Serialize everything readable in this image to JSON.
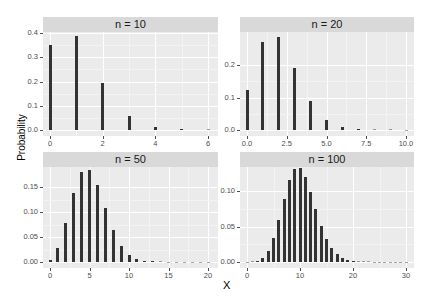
{
  "chart_data": [
    {
      "type": "bar",
      "title": "n = 10",
      "xlabel": "X",
      "ylabel": "Probability",
      "x": [
        0,
        1,
        2,
        3,
        4,
        5,
        6
      ],
      "values": [
        0.349,
        0.387,
        0.194,
        0.057,
        0.011,
        0.001,
        0.0001
      ],
      "xlim": [
        0,
        6
      ],
      "ylim": [
        0,
        0.4
      ],
      "xticks": [
        "0",
        "2",
        "4",
        "6"
      ],
      "yticks": [
        "0.0",
        "0.1",
        "0.2",
        "0.3",
        "0.4"
      ]
    },
    {
      "type": "bar",
      "title": "n = 20",
      "xlabel": "X",
      "ylabel": "Probability",
      "x": [
        0,
        1,
        2,
        3,
        4,
        5,
        6,
        7,
        8,
        9,
        10
      ],
      "values": [
        0.122,
        0.27,
        0.285,
        0.19,
        0.09,
        0.032,
        0.009,
        0.002,
        0.0004,
        0.0001,
        0.0
      ],
      "xlim": [
        0,
        10
      ],
      "ylim": [
        0,
        0.29
      ],
      "xticks": [
        "0.0",
        "2.5",
        "5.0",
        "7.5",
        "10.0"
      ],
      "yticks": [
        "0.0",
        "0.1",
        "0.2"
      ]
    },
    {
      "type": "bar",
      "title": "n = 50",
      "xlabel": "X",
      "ylabel": "Probability",
      "x": [
        0,
        1,
        2,
        3,
        4,
        5,
        6,
        7,
        8,
        9,
        10,
        11,
        12,
        13,
        14,
        15,
        16,
        17,
        18,
        19,
        20
      ],
      "values": [
        0.005,
        0.029,
        0.078,
        0.139,
        0.181,
        0.185,
        0.154,
        0.108,
        0.064,
        0.033,
        0.015,
        0.006,
        0.002,
        0.001,
        0.0002,
        0.0,
        0.0,
        0.0,
        0.0,
        0.0,
        0.0
      ],
      "xlim": [
        0,
        20
      ],
      "ylim": [
        0,
        0.185
      ],
      "xticks": [
        "0",
        "5",
        "10",
        "15",
        "20"
      ],
      "yticks": [
        "0.00",
        "0.05",
        "0.10",
        "0.15"
      ]
    },
    {
      "type": "bar",
      "title": "n = 100",
      "xlabel": "X",
      "ylabel": "Probability",
      "x": [
        0,
        1,
        2,
        3,
        4,
        5,
        6,
        7,
        8,
        9,
        10,
        11,
        12,
        13,
        14,
        15,
        16,
        17,
        18,
        19,
        20,
        21,
        22,
        23,
        24,
        25,
        26,
        27,
        28,
        29,
        30
      ],
      "values": [
        0.0,
        0.0003,
        0.0016,
        0.0059,
        0.0159,
        0.0339,
        0.0596,
        0.0889,
        0.1148,
        0.1304,
        0.1319,
        0.1199,
        0.0988,
        0.0743,
        0.0513,
        0.0327,
        0.0193,
        0.0106,
        0.0054,
        0.0026,
        0.0012,
        0.0005,
        0.0002,
        0.0001,
        0.0,
        0.0,
        0.0,
        0.0,
        0.0,
        0.0,
        0.0
      ],
      "xlim": [
        0,
        30
      ],
      "ylim": [
        0,
        0.132
      ],
      "xticks": [
        "0",
        "10",
        "20",
        "30"
      ],
      "yticks": [
        "0.00",
        "0.05",
        "0.10"
      ]
    }
  ],
  "labels": {
    "xlabel": "X",
    "ylabel": "Probability",
    "panel_titles": [
      "n = 10",
      "n = 20",
      "n = 50",
      "n = 100"
    ]
  },
  "layout": {
    "panels": [
      {
        "left": 43,
        "top": 17,
        "width": 175,
        "plot_top": 32,
        "plot_height": 104,
        "zero_y": 130,
        "x0": 50,
        "x1": 208,
        "xmax": 6,
        "ymax_val": 0.4,
        "ymax_px": 33,
        "yticks_val": [
          0,
          0.1,
          0.2,
          0.3,
          0.4
        ],
        "xticks_val": [
          0,
          2,
          4,
          6
        ],
        "bar_w": 3
      },
      {
        "left": 240,
        "top": 17,
        "width": 174,
        "plot_top": 32,
        "plot_height": 104,
        "zero_y": 130,
        "x0": 247,
        "x1": 406,
        "xmax": 10,
        "ymax_val": 0.2,
        "ymax_px": 65,
        "yticks_val": [
          0,
          0.1,
          0.2
        ],
        "xticks_val": [
          0,
          2.5,
          5,
          7.5,
          10
        ],
        "bar_w": 3
      },
      {
        "left": 43,
        "top": 152,
        "width": 175,
        "plot_top": 167,
        "plot_height": 101,
        "zero_y": 262,
        "x0": 50,
        "x1": 208,
        "xmax": 20,
        "ymax_val": 0.15,
        "ymax_px": 187,
        "yticks_val": [
          0,
          0.05,
          0.1,
          0.15
        ],
        "xticks_val": [
          0,
          5,
          10,
          15,
          20
        ],
        "bar_w": 3
      },
      {
        "left": 240,
        "top": 152,
        "width": 174,
        "plot_top": 167,
        "plot_height": 101,
        "zero_y": 262,
        "x0": 247,
        "x1": 406,
        "xmax": 30,
        "ymax_val": 0.1,
        "ymax_px": 191,
        "yticks_val": [
          0,
          0.05,
          0.1
        ],
        "xticks_val": [
          0,
          10,
          20,
          30
        ],
        "bar_w": 3
      }
    ]
  }
}
